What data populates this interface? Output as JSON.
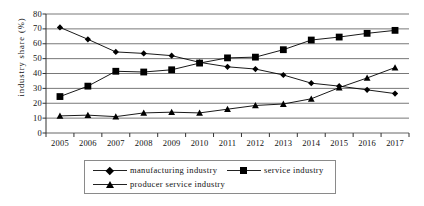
{
  "chart_data": {
    "type": "line",
    "title": "",
    "xlabel": "",
    "ylabel": "industry share (%)",
    "categories": [
      "2005",
      "2006",
      "2007",
      "2008",
      "2009",
      "2010",
      "2011",
      "2012",
      "2013",
      "2014",
      "2015",
      "2016",
      "2017"
    ],
    "ylim": [
      0,
      80
    ],
    "ytick_step": 10,
    "yticks": [
      "80",
      "70",
      "60",
      "50",
      "40",
      "30",
      "20",
      "10",
      "0"
    ],
    "grid": "horizontal",
    "legend_position": "bottom",
    "series": [
      {
        "name": "manufacturing industry",
        "marker": "diamond",
        "color": "#000000",
        "values": [
          71,
          63,
          54.5,
          53.5,
          52,
          47.5,
          44.5,
          43,
          39,
          33.5,
          31.5,
          29,
          26.5
        ]
      },
      {
        "name": "service industry",
        "marker": "square",
        "color": "#000000",
        "values": [
          24.5,
          31.5,
          41.5,
          41,
          42.5,
          47,
          50.5,
          51,
          56,
          62.5,
          64.5,
          67,
          69
        ]
      },
      {
        "name": "producer service industry",
        "marker": "triangle",
        "color": "#000000",
        "values": [
          11.5,
          12,
          11,
          13.5,
          14,
          13.5,
          16,
          18.5,
          19.5,
          23,
          30.5,
          37,
          44
        ]
      }
    ]
  },
  "legend": {
    "items": [
      {
        "label": "manufacturing industry"
      },
      {
        "label": "service industry"
      },
      {
        "label": "producer service industry"
      }
    ]
  }
}
